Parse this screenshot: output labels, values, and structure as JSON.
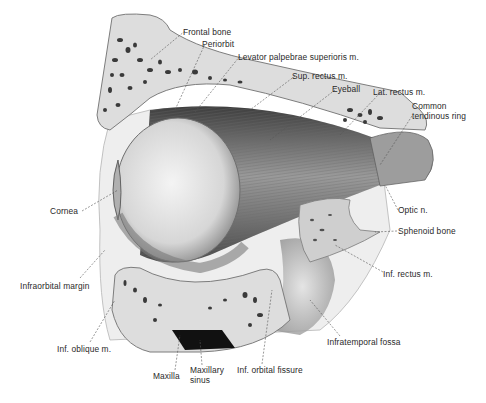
{
  "figure": {
    "colors": {
      "bone": "#dcdcdc",
      "bone_outline": "#8a8a8a",
      "muscle_dark": "#4a4a4a",
      "muscle_mid": "#8c8c8c",
      "eyeball": "#e9e9e9",
      "sinus": "#111111",
      "leader": "#555555"
    }
  },
  "labels": [
    {
      "id": "frontal-bone",
      "text": "Frontal bone",
      "x": 183,
      "y": 28
    },
    {
      "id": "periorbit",
      "text": "Periorbit",
      "x": 202,
      "y": 40
    },
    {
      "id": "levator",
      "text": "Levator palpebrae superioris m.",
      "x": 238,
      "y": 53
    },
    {
      "id": "sup-rectus",
      "text": "Sup. rectus m.",
      "x": 292,
      "y": 72
    },
    {
      "id": "eyeball",
      "text": "Eyeball",
      "x": 332,
      "y": 85
    },
    {
      "id": "lat-rectus",
      "text": "Lat. rectus m.",
      "x": 373,
      "y": 88
    },
    {
      "id": "common-ring-1",
      "text": "Common",
      "x": 412,
      "y": 102
    },
    {
      "id": "common-ring-2",
      "text": "tendinous ring",
      "x": 412,
      "y": 112
    },
    {
      "id": "cornea",
      "text": "Cornea",
      "x": 50,
      "y": 207
    },
    {
      "id": "optic-n",
      "text": "Optic n.",
      "x": 398,
      "y": 206
    },
    {
      "id": "sphenoid",
      "text": "Sphenoid bone",
      "x": 398,
      "y": 227
    },
    {
      "id": "infraorbital-margin",
      "text": "Infraorbital margin",
      "x": 20,
      "y": 282
    },
    {
      "id": "inf-rectus",
      "text": "Inf. rectus m.",
      "x": 383,
      "y": 270
    },
    {
      "id": "infratemporal",
      "text": "Infratemporal fossa",
      "x": 327,
      "y": 338
    },
    {
      "id": "inf-oblique",
      "text": "Inf. oblique m.",
      "x": 57,
      "y": 345
    },
    {
      "id": "maxilla",
      "text": "Maxilla",
      "x": 153,
      "y": 372
    },
    {
      "id": "maxillary-sinus-1",
      "text": "Maxillary",
      "x": 190,
      "y": 366
    },
    {
      "id": "maxillary-sinus-2",
      "text": "sinus",
      "x": 190,
      "y": 376
    },
    {
      "id": "inf-orbital-fissure",
      "text": "Inf. orbital fissure",
      "x": 237,
      "y": 366
    }
  ]
}
